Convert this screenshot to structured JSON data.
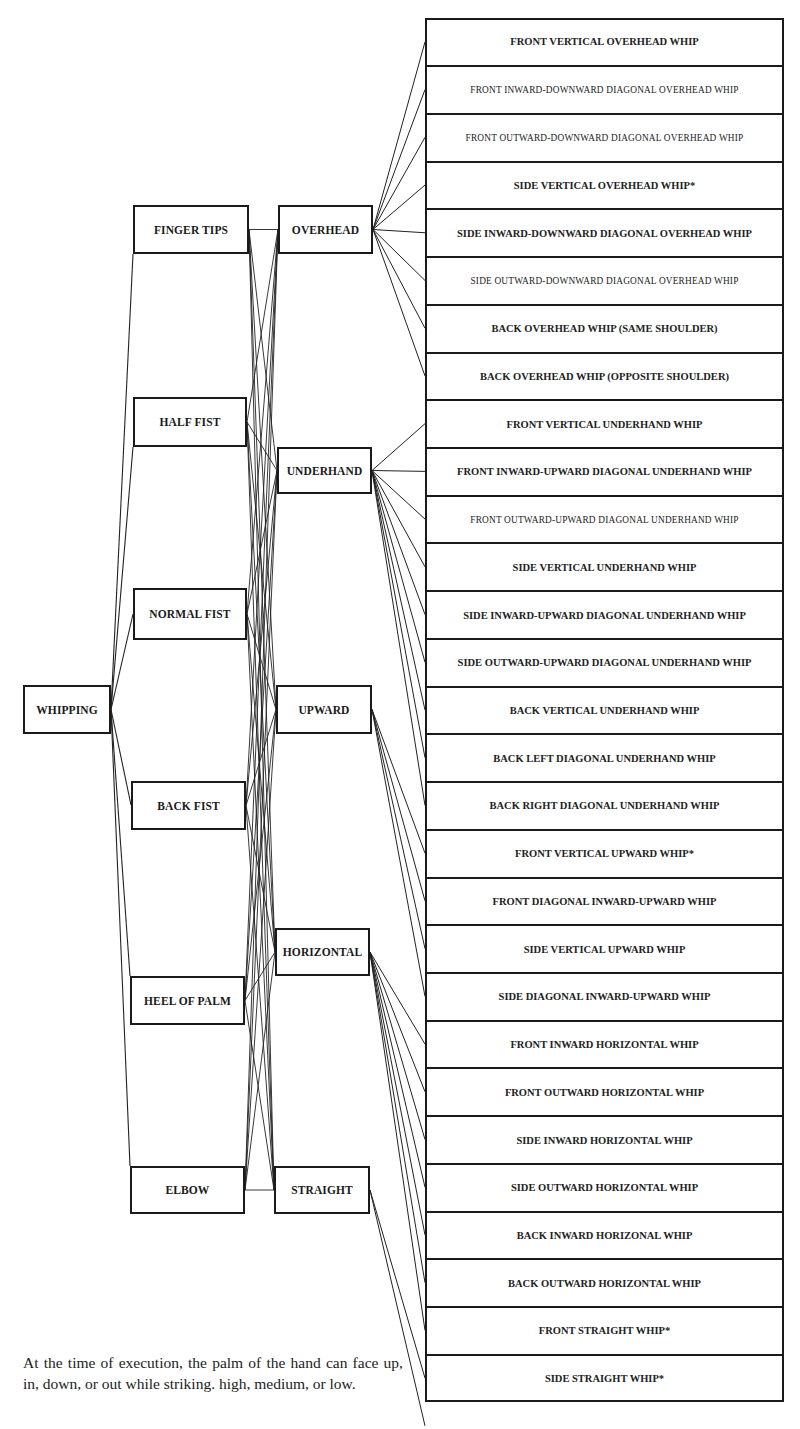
{
  "diagram": {
    "root": {
      "label": "WHIPPING",
      "box": [
        23,
        685,
        88,
        49
      ]
    },
    "hand_parts": [
      {
        "label": "FINGER TIPS",
        "box": [
          133,
          205,
          116,
          49
        ],
        "root_anchor": [
          133,
          254
        ]
      },
      {
        "label": "HALF FIST",
        "box": [
          133,
          397,
          114,
          50
        ],
        "root_anchor": [
          133,
          447
        ]
      },
      {
        "label": "NORMAL FIST",
        "box": [
          133,
          588,
          114,
          52
        ],
        "root_anchor": [
          133,
          614
        ]
      },
      {
        "label": "BACK FIST",
        "box": [
          131,
          781,
          115,
          49
        ],
        "root_anchor": [
          131,
          805
        ]
      },
      {
        "label": "HEEL OF PALM",
        "box": [
          130,
          976,
          115,
          49
        ],
        "root_anchor": [
          130,
          976
        ]
      },
      {
        "label": "ELBOW",
        "box": [
          130,
          1166,
          115,
          48
        ],
        "root_anchor": [
          130,
          1166
        ]
      }
    ],
    "directions": [
      {
        "label": "OVERHEAD",
        "box": [
          278,
          205,
          95,
          49
        ],
        "rows": [
          0,
          7
        ]
      },
      {
        "label": "UNDERHAND",
        "box": [
          277,
          447,
          95,
          47
        ],
        "rows": [
          8,
          16
        ]
      },
      {
        "label": "UPWARD",
        "box": [
          276,
          685,
          96,
          49
        ],
        "rows": [
          17,
          20
        ]
      },
      {
        "label": "HORIZONTAL",
        "box": [
          275,
          928,
          95,
          48
        ],
        "rows": [
          21,
          27
        ]
      },
      {
        "label": "STRAIGHT",
        "box": [
          274,
          1166,
          96,
          48
        ],
        "rows": [
          28,
          29
        ]
      }
    ],
    "ladder": {
      "box": [
        425,
        18,
        359,
        1384
      ],
      "rows": [
        {
          "label": "FRONT VERTICAL OVERHEAD WHIP",
          "small": false
        },
        {
          "label": "FRONT INWARD-DOWNWARD DIAGONAL OVERHEAD WHIP",
          "small": true
        },
        {
          "label": "FRONT OUTWARD-DOWNWARD DIAGONAL OVERHEAD WHIP",
          "small": true
        },
        {
          "label": "SIDE VERTICAL OVERHEAD WHIP*",
          "small": false
        },
        {
          "label": "SIDE INWARD-DOWNWARD DIAGONAL OVERHEAD WHIP",
          "small": false
        },
        {
          "label": "SIDE OUTWARD-DOWNWARD DIAGONAL OVERHEAD WHIP",
          "small": true
        },
        {
          "label": "BACK OVERHEAD WHIP (SAME SHOULDER)",
          "small": false
        },
        {
          "label": "BACK OVERHEAD WHIP (OPPOSITE SHOULDER)",
          "small": false
        },
        {
          "label": "FRONT VERTICAL UNDERHAND WHIP",
          "small": false
        },
        {
          "label": "FRONT INWARD-UPWARD DIAGONAL UNDERHAND WHIP",
          "small": false
        },
        {
          "label": "FRONT OUTWARD-UPWARD DIAGONAL UNDERHAND WHIP",
          "small": true
        },
        {
          "label": "SIDE VERTICAL UNDERHAND WHIP",
          "small": false
        },
        {
          "label": "SIDE INWARD-UPWARD DIAGONAL UNDERHAND WHIP",
          "small": false
        },
        {
          "label": "SIDE OUTWARD-UPWARD DIAGONAL UNDERHAND WHIP",
          "small": false
        },
        {
          "label": "BACK VERTICAL UNDERHAND WHIP",
          "small": false
        },
        {
          "label": "BACK LEFT DIAGONAL UNDERHAND WHIP",
          "small": false
        },
        {
          "label": "BACK RIGHT DIAGONAL UNDERHAND WHIP",
          "small": false
        },
        {
          "label": "FRONT VERTICAL UPWARD WHIP*",
          "small": false
        },
        {
          "label": "FRONT DIAGONAL INWARD-UPWARD WHIP",
          "small": false
        },
        {
          "label": "SIDE VERTICAL UPWARD WHIP",
          "small": false
        },
        {
          "label": "SIDE DIAGONAL INWARD-UPWARD WHIP",
          "small": false
        },
        {
          "label": "FRONT INWARD HORIZONTAL WHIP",
          "small": false
        },
        {
          "label": "FRONT OUTWARD HORIZONTAL WHIP",
          "small": false
        },
        {
          "label": "SIDE INWARD HORIZONTAL WHIP",
          "small": false
        },
        {
          "label": "SIDE OUTWARD HORIZONTAL WHIP",
          "small": false
        },
        {
          "label": "BACK INWARD HORIZONAL WHIP",
          "small": false
        },
        {
          "label": "BACK OUTWARD HORIZONTAL WHIP",
          "small": false
        },
        {
          "label": "FRONT STRAIGHT WHIP*",
          "small": false
        },
        {
          "label": "SIDE STRAIGHT WHIP*",
          "small": false
        }
      ]
    },
    "line_color": "#222222",
    "box_color": "#1a1a1a"
  },
  "caption": "At the time of execution, the palm of the hand can face up, in, down, or out while striking. high, medium, or low."
}
